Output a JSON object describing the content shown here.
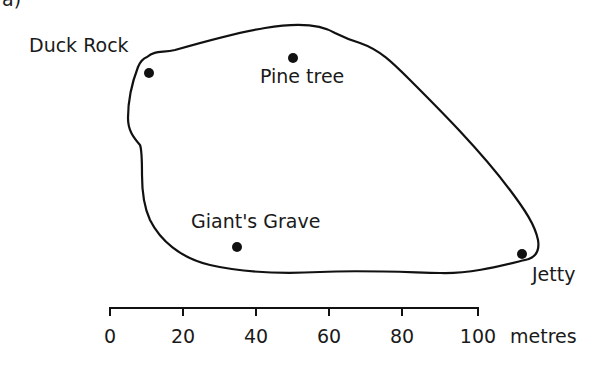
{
  "part_label": "a)",
  "map": {
    "places": [
      {
        "name": "Duck Rock",
        "x": 148,
        "y": 73
      },
      {
        "name": "Pine tree",
        "x": 293,
        "y": 58
      },
      {
        "name": "Giant's Grave",
        "x": 237,
        "y": 247
      },
      {
        "name": "Jetty",
        "x": 522,
        "y": 254
      }
    ],
    "colors": {
      "outline": "#111111",
      "marker": "#111111",
      "text": "#1a1a1a"
    }
  },
  "scale_bar": {
    "ticks": [
      "0",
      "20",
      "40",
      "60",
      "80",
      "100"
    ],
    "unit": "metres",
    "start_x": 110,
    "end_x": 478,
    "y": 308
  }
}
